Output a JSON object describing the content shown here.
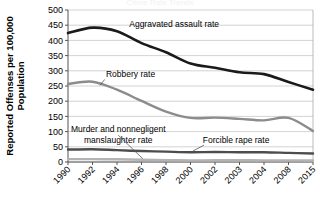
{
  "figure": {
    "cropped_title": "Crime Rate Trends",
    "background": "#ffffff"
  },
  "chart_data": {
    "type": "line",
    "title": "",
    "xlabel": "",
    "ylabel": "Reported Offenses per 100,000 Population",
    "ylim": [
      0,
      500
    ],
    "yticks": [
      0,
      50,
      100,
      150,
      200,
      250,
      300,
      350,
      400,
      450,
      500
    ],
    "grid": true,
    "grid_color": "#c8c8c8",
    "legend_position": "inline-annotations",
    "categories": [
      "1990",
      "1992",
      "1994",
      "1996",
      "1998",
      "2000",
      "2002",
      "2003",
      "2004",
      "2008",
      "2015"
    ],
    "series": [
      {
        "name": "Aggravated assault rate",
        "color": "#1a1a1a",
        "linewidth": 2.6,
        "values": [
          424,
          442,
          430,
          391,
          361,
          324,
          310,
          295,
          289,
          263,
          238
        ],
        "label_x": "1996",
        "label_y": 455
      },
      {
        "name": "Robbery rate",
        "color": "#8c8c8c",
        "linewidth": 2.4,
        "values": [
          257,
          264,
          238,
          201,
          166,
          145,
          146,
          142,
          137,
          145,
          102
        ],
        "label_x": "1993",
        "label_y": 288
      },
      {
        "name": "Forcible rape rate",
        "color": "#4d4d4d",
        "linewidth": 2.4,
        "values": [
          41,
          42,
          39,
          36,
          34,
          32,
          33,
          32,
          32,
          30,
          28
        ],
        "label_x": "2002",
        "label_y": 72
      },
      {
        "name": "Murder and nonnegligent manslaughter rate",
        "color": "#b3b3b3",
        "linewidth": 2.4,
        "values": [
          9.4,
          9.3,
          9.0,
          7.4,
          6.3,
          5.5,
          5.6,
          5.7,
          5.5,
          5.4,
          4.9
        ],
        "label_x": "1993",
        "label_y": 108
      }
    ],
    "annotations": [
      {
        "name": "aggravated-assault-label",
        "text": "Aggravated assault rate"
      },
      {
        "name": "robbery-label",
        "text": "Robbery rate"
      },
      {
        "name": "murder-label-line1",
        "text": "Murder and nonnegligent"
      },
      {
        "name": "murder-label-line2",
        "text": "manslaughter rate"
      },
      {
        "name": "forcible-rape-label",
        "text": "Forcible rape rate"
      }
    ]
  }
}
